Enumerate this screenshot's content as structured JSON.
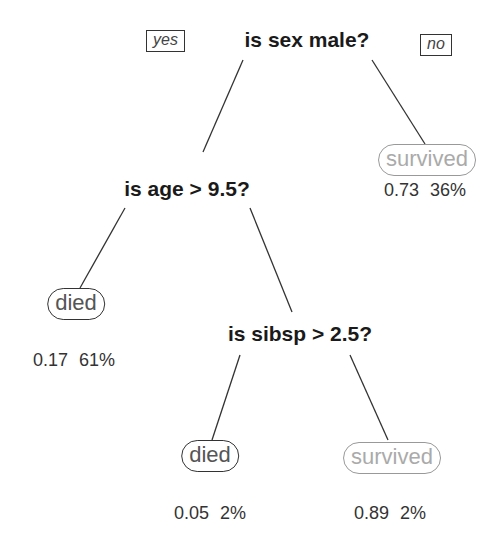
{
  "tree": {
    "edge_labels": {
      "yes": "yes",
      "no": "no"
    },
    "nodes": {
      "root": {
        "question": "is sex male?"
      },
      "age": {
        "question": "is age > 9.5?"
      },
      "sibsp": {
        "question": "is sibsp > 2.5?"
      }
    },
    "leaves": {
      "survived_female": {
        "label": "survived",
        "prob": "0.73",
        "pct": "36%"
      },
      "died_adult_male": {
        "label": "died",
        "prob": "0.17",
        "pct": "61%"
      },
      "died_boy_large_family": {
        "label": "died",
        "prob": "0.05",
        "pct": "2%"
      },
      "survived_boy_small_family": {
        "label": "survived",
        "prob": "0.89",
        "pct": "2%"
      }
    }
  }
}
